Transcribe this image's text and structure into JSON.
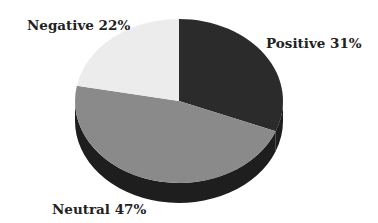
{
  "chart_data": {
    "type": "pie",
    "style": "3d",
    "title": "",
    "categories": [
      "Positive",
      "Neutral",
      "Negative"
    ],
    "values": [
      31,
      47,
      22
    ],
    "unit": "%",
    "start_angle": "12 o'clock",
    "direction": "clockwise",
    "legend": "none (inline labels)",
    "colors": [
      "#2b2b2b",
      "#8a8a8a",
      "#ececec"
    ],
    "labels": [
      {
        "text": "Positive 31%",
        "position": "upper-right"
      },
      {
        "text": "Neutral 47%",
        "position": "bottom-left"
      },
      {
        "text": "Negative 22%",
        "position": "upper-left"
      }
    ]
  },
  "labels": {
    "positive": "Positive 31%",
    "neutral": "Neutral 47%",
    "negative": "Negative 22%"
  }
}
